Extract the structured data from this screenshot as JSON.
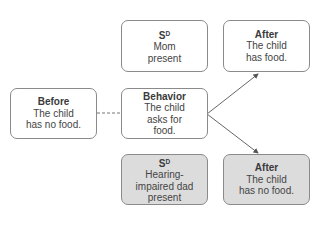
{
  "diagram": {
    "before": {
      "title": "Before",
      "lines": [
        "The child",
        "has no food."
      ]
    },
    "behavior": {
      "title": "Behavior",
      "lines": [
        "The child",
        "asks for",
        "food."
      ]
    },
    "sd_top": {
      "title_main": "S",
      "title_sup": "D",
      "lines": [
        "Mom",
        "present"
      ]
    },
    "after_top": {
      "title": "After",
      "lines": [
        "The child",
        "has food."
      ]
    },
    "sd_bottom": {
      "title_main": "S",
      "title_sup": "D",
      "lines": [
        "Hearing-",
        "impaired dad",
        "present"
      ]
    },
    "after_bottom": {
      "title": "After",
      "lines": [
        "The child",
        "has no food."
      ]
    },
    "colors": {
      "border": "#8a8a8a",
      "shaded_fill": "#dcdcdc",
      "text": "#444444",
      "line": "#555555"
    }
  }
}
